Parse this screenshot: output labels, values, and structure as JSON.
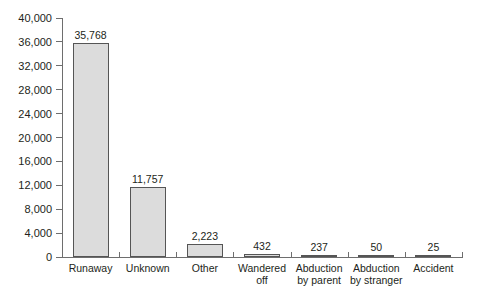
{
  "chart_data": {
    "type": "bar",
    "title": "",
    "xlabel": "",
    "ylabel": "",
    "categories": [
      "Runaway",
      "Unknown",
      "Other",
      "Wandered off",
      "Abduction by parent",
      "Abduction by stranger",
      "Accident"
    ],
    "values": [
      35768,
      11757,
      2223,
      432,
      237,
      50,
      25
    ],
    "value_labels": [
      "35,768",
      "11,757",
      "2,223",
      "432",
      "237",
      "50",
      "25"
    ],
    "ylim": [
      0,
      40000
    ],
    "ytick_values": [
      0,
      4000,
      8000,
      12000,
      16000,
      20000,
      24000,
      28000,
      32000,
      36000,
      40000
    ],
    "ytick_labels": [
      "0",
      "4,000",
      "8,000",
      "12,000",
      "16,000",
      "20,000",
      "24,000",
      "28,000",
      "32,000",
      "36,000",
      "40,000"
    ],
    "grid": false,
    "legend": null,
    "bar_color": "#dcdcdc",
    "bar_border_color": "#555555",
    "axis_color": "#6e6e6e",
    "text_color": "#231f20"
  },
  "category_label_lines": [
    [
      "Runaway"
    ],
    [
      "Unknown"
    ],
    [
      "Other"
    ],
    [
      "Wandered",
      "off"
    ],
    [
      "Abduction",
      "by parent"
    ],
    [
      "Abduction",
      "by stranger"
    ],
    [
      "Accident"
    ]
  ]
}
